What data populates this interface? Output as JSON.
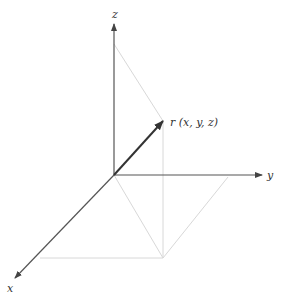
{
  "diagram": {
    "axes": {
      "x_label": "x",
      "y_label": "y",
      "z_label": "z"
    },
    "vector_label": "r (x, y, z)",
    "colors": {
      "axis": "#555555",
      "vector": "#333333",
      "guide": "#d0d0d0"
    }
  }
}
